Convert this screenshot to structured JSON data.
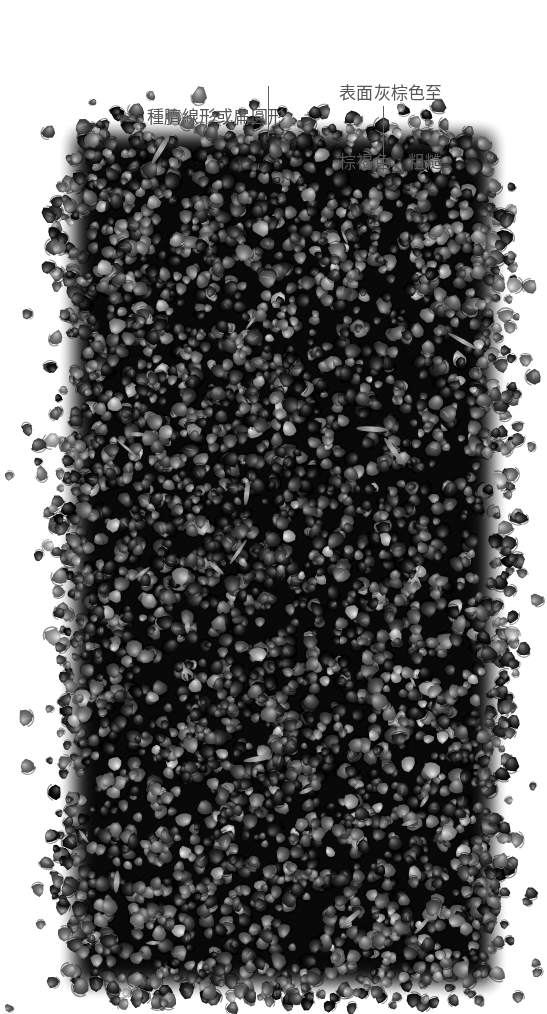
{
  "figure": {
    "width": 547,
    "height": 1014,
    "background_color": "#ffffff",
    "rendering": "grayscale-photograph"
  },
  "decoration": {
    "dashed_arc": {
      "name": "dashed-circle-arc",
      "style": "square-dashes",
      "color": "#555555",
      "dash_size": 6,
      "center_x": 76,
      "center_y": -126,
      "radius": 160,
      "start_angle_deg": 55,
      "end_angle_deg": 125,
      "dash_count": 17
    }
  },
  "annotations": [
    {
      "name": "annotation-hilum",
      "lines": [
        "種臍線形或扁圓形"
      ],
      "x": 147,
      "y": 60,
      "color": "#575757",
      "leader": {
        "x": 268,
        "y_start": 86,
        "y_end": 136
      }
    },
    {
      "name": "annotation-surface",
      "lines": [
        "表面灰棕色至",
        "棕褐色，粗糙"
      ],
      "x": 339,
      "y": 36,
      "color": "#575757",
      "leader": {
        "x": 383,
        "y_start": 106,
        "y_end": 171
      }
    }
  ],
  "specimen": {
    "name": "seed-mass",
    "description": "dense pile of small rounded seeds, grayscale",
    "mass_bounds": {
      "left": 58,
      "top": 118,
      "right": 508,
      "bottom": 1000
    },
    "seed_count_drawn": 3600,
    "seed_diameter_min": 9,
    "seed_diameter_max": 19,
    "seed_fill_dark": "#2b2b2b",
    "seed_fill_mid": "#4e4e4e",
    "seed_fill_light": "#7d7d7d",
    "seed_highlight": "#a6a6a6",
    "chaff_color": "#b4b4b4",
    "chaff_count": 26,
    "stray_seed_count": 70,
    "shadow_color": "#151515"
  }
}
